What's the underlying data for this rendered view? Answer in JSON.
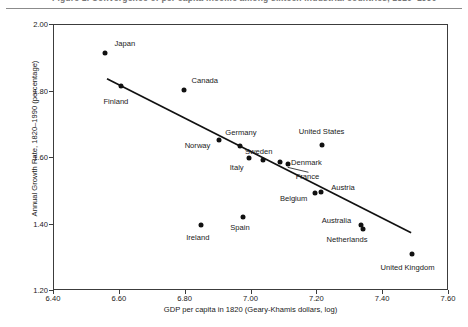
{
  "caption": {
    "text": "Figure 1. Convergence of per capita income among sixteen industrial countries, 1820–1990",
    "rule": true
  },
  "chart_data": {
    "type": "scatter",
    "title": "",
    "xlabel": "GDP per capita in 1820 (Geary-Khamis dollars, log)",
    "ylabel": "Annual Growth Rate, 1820–1990 (percentage)",
    "xlim": [
      6.4,
      7.6
    ],
    "ylim": [
      1.2,
      2.0
    ],
    "xticks": [
      "6.40",
      "6.60",
      "6.80",
      "7.00",
      "7.20",
      "7.40",
      "7.60"
    ],
    "yticks": [
      "1.20",
      "1.40",
      "1.60",
      "1.80",
      "2.00"
    ],
    "grid": false,
    "legend": null,
    "points": [
      {
        "label": "Japan",
        "x": 6.555,
        "y": 1.916,
        "lx": 6.615,
        "ly": 1.945,
        "anchor": "left"
      },
      {
        "label": "Finland",
        "x": 6.603,
        "y": 1.816,
        "lx": 6.588,
        "ly": 1.772,
        "anchor": "center"
      },
      {
        "label": "Canada",
        "x": 6.796,
        "y": 1.806,
        "lx": 6.858,
        "ly": 1.836,
        "anchor": "left"
      },
      {
        "label": "Norway",
        "x": 6.901,
        "y": 1.653,
        "lx": 6.836,
        "ly": 1.638,
        "anchor": "center"
      },
      {
        "label": "Germany",
        "x": 6.965,
        "y": 1.635,
        "lx": 6.968,
        "ly": 1.678,
        "anchor": "center"
      },
      {
        "label": "Sweden",
        "x": 7.035,
        "y": 1.593,
        "lx": 7.022,
        "ly": 1.622,
        "anchor": "center"
      },
      {
        "label": "Italy",
        "x": 6.992,
        "y": 1.599,
        "lx": 6.955,
        "ly": 1.572,
        "anchor": "center"
      },
      {
        "label": "Denmark",
        "x": 7.088,
        "y": 1.587,
        "lx": 7.167,
        "ly": 1.587,
        "anchor": "left"
      },
      {
        "label": "France",
        "x": 7.11,
        "y": 1.581,
        "lx": 7.17,
        "ly": 1.545,
        "anchor": "left"
      },
      {
        "label": "United States",
        "x": 7.215,
        "y": 1.639,
        "lx": 7.213,
        "ly": 1.681,
        "anchor": "center"
      },
      {
        "label": "Belgium",
        "x": 7.194,
        "y": 1.495,
        "lx": 7.128,
        "ly": 1.48,
        "anchor": "center"
      },
      {
        "label": "Austria",
        "x": 7.212,
        "y": 1.498,
        "lx": 7.278,
        "ly": 1.513,
        "anchor": "center"
      },
      {
        "label": "Spain",
        "x": 6.974,
        "y": 1.423,
        "lx": 6.965,
        "ly": 1.393,
        "anchor": "center"
      },
      {
        "label": "Ireland",
        "x": 6.847,
        "y": 1.397,
        "lx": 6.837,
        "ly": 1.363,
        "anchor": "center"
      },
      {
        "label": "Australia",
        "x": 7.333,
        "y": 1.397,
        "lx": 7.258,
        "ly": 1.414,
        "anchor": "center"
      },
      {
        "label": "Netherlands",
        "x": 7.338,
        "y": 1.385,
        "lx": 7.29,
        "ly": 1.357,
        "anchor": "center"
      },
      {
        "label": "United Kingdom",
        "x": 7.487,
        "y": 1.311,
        "lx": 7.474,
        "ly": 1.272,
        "anchor": "center"
      }
    ],
    "trendline": {
      "x1": 6.561,
      "y1": 1.838,
      "x2": 7.485,
      "y2": 1.375
    }
  }
}
